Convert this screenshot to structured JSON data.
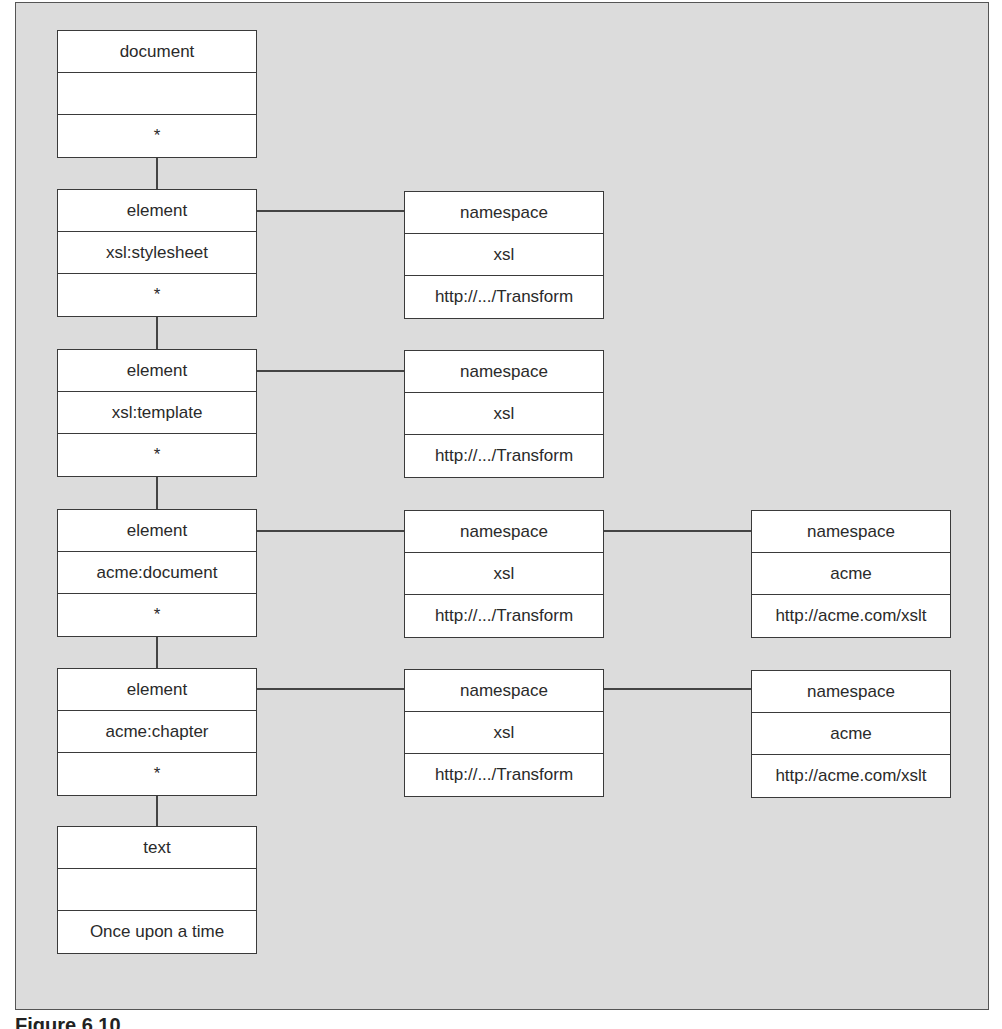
{
  "figure": {
    "caption": "Figure 6.10"
  },
  "nodes": {
    "document": {
      "type": "document",
      "name": "",
      "value": "*"
    },
    "el_stylesheet": {
      "type": "element",
      "name": "xsl:stylesheet",
      "value": "*"
    },
    "ns_stylesheet": {
      "type": "namespace",
      "name": "xsl",
      "value": "http://.../Transform"
    },
    "el_template": {
      "type": "element",
      "name": "xsl:template",
      "value": "*"
    },
    "ns_template": {
      "type": "namespace",
      "name": "xsl",
      "value": "http://.../Transform"
    },
    "el_document": {
      "type": "element",
      "name": "acme:document",
      "value": "*"
    },
    "ns_document_xsl": {
      "type": "namespace",
      "name": "xsl",
      "value": "http://.../Transform"
    },
    "ns_document_acme": {
      "type": "namespace",
      "name": "acme",
      "value": "http://acme.com/xslt"
    },
    "el_chapter": {
      "type": "element",
      "name": "acme:chapter",
      "value": "*"
    },
    "ns_chapter_xsl": {
      "type": "namespace",
      "name": "xsl",
      "value": "http://.../Transform"
    },
    "ns_chapter_acme": {
      "type": "namespace",
      "name": "acme",
      "value": "http://acme.com/xslt"
    },
    "text": {
      "type": "text",
      "name": "",
      "value": "Once upon a time"
    }
  },
  "edges": [
    [
      "document",
      "el_stylesheet"
    ],
    [
      "el_stylesheet",
      "ns_stylesheet"
    ],
    [
      "el_stylesheet",
      "el_template"
    ],
    [
      "el_template",
      "ns_template"
    ],
    [
      "el_template",
      "el_document"
    ],
    [
      "el_document",
      "ns_document_xsl"
    ],
    [
      "ns_document_xsl",
      "ns_document_acme"
    ],
    [
      "el_document",
      "el_chapter"
    ],
    [
      "el_chapter",
      "ns_chapter_xsl"
    ],
    [
      "ns_chapter_xsl",
      "ns_chapter_acme"
    ],
    [
      "el_chapter",
      "text"
    ]
  ]
}
